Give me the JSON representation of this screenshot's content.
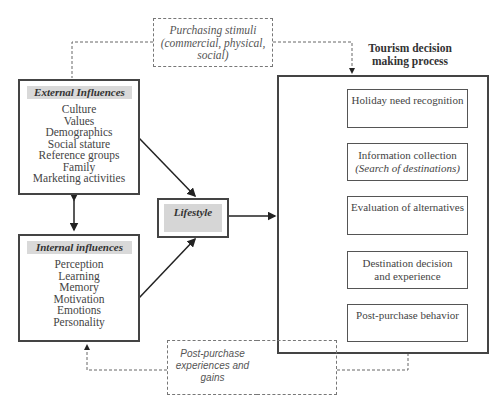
{
  "diagram": {
    "purchasing_stimuli": {
      "line1": "Purchasing stimuli",
      "line2": "(commercial, physical,",
      "line3": "social)"
    },
    "process_title": {
      "line1": "Tourism decision",
      "line2": "making process"
    },
    "external_influences": {
      "title": "External Influences",
      "items": [
        "Culture",
        "Values",
        "Demographics",
        "Social stature",
        "Reference groups",
        "Family",
        "Marketing activities"
      ]
    },
    "internal_influences": {
      "title": "Internal influences",
      "items": [
        "Perception",
        "Learning",
        "Memory",
        "Motivation",
        "Emotions",
        "Personality"
      ]
    },
    "lifestyle": {
      "title": "Lifestyle"
    },
    "steps": [
      {
        "line1": "Holiday need recognition"
      },
      {
        "line1": "Information collection",
        "line2": "(Search of destinations)"
      },
      {
        "line1": "Evaluation of alternatives"
      },
      {
        "line1": "Destination decision",
        "line2": "and experience"
      },
      {
        "line1": "Post-purchase behavior"
      }
    ],
    "post_purchase": {
      "line1": "Post-purchase",
      "line2": "experiences and",
      "line3": "gains"
    }
  }
}
